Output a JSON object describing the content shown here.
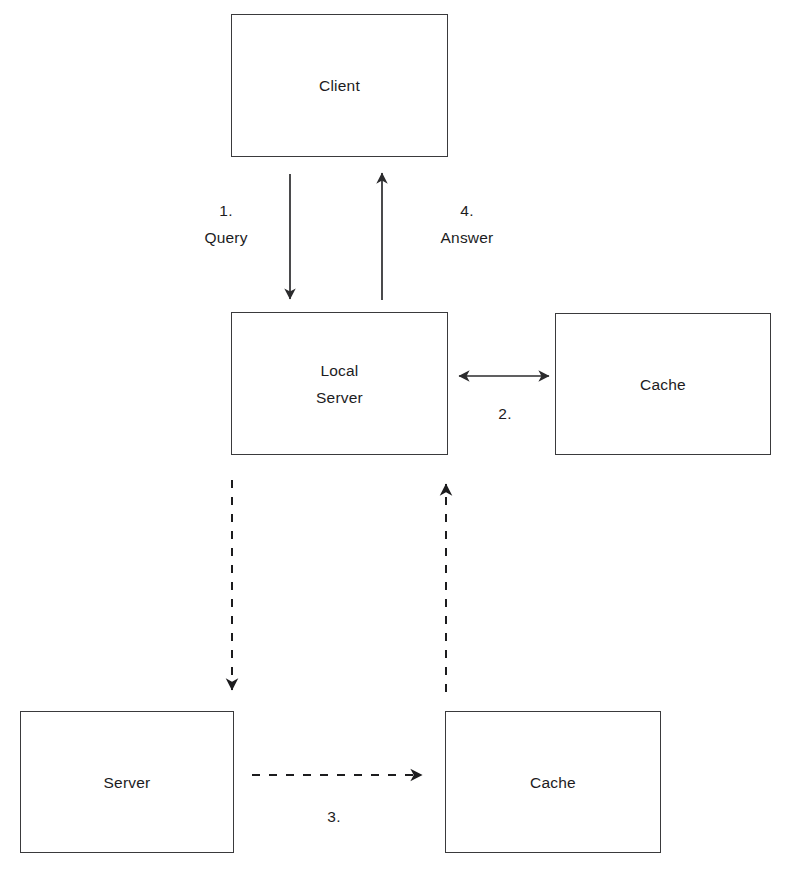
{
  "diagram": {
    "type": "flow-diagram",
    "background_color": "#ffffff",
    "stroke_color": "#3a3a3c",
    "text_color": "#1c1c1e",
    "nodes": [
      {
        "id": "client",
        "label": "Client",
        "x": 231,
        "y": 14,
        "w": 217,
        "h": 143
      },
      {
        "id": "local-server",
        "label": "Local\nServer",
        "x": 231,
        "y": 312,
        "w": 217,
        "h": 143
      },
      {
        "id": "local-cache",
        "label": "Cache",
        "x": 555,
        "y": 313,
        "w": 216,
        "h": 142
      },
      {
        "id": "server",
        "label": "Server",
        "x": 20,
        "y": 711,
        "w": 214,
        "h": 142
      },
      {
        "id": "remote-cache",
        "label": "Cache",
        "x": 445,
        "y": 711,
        "w": 216,
        "h": 142
      }
    ],
    "edges": [
      {
        "id": "client-to-local-server",
        "label": "1.\nQuery",
        "label_x": 226,
        "label_y": 224,
        "style": "solid",
        "direction": "down",
        "from": "client",
        "to": "local-server",
        "x1": 290,
        "y1": 174,
        "x2": 290,
        "y2": 299
      },
      {
        "id": "local-server-to-client",
        "label": "4.\nAnswer",
        "label_x": 467,
        "label_y": 224,
        "style": "solid",
        "direction": "up",
        "from": "local-server",
        "to": "client",
        "x1": 382,
        "y1": 300,
        "x2": 382,
        "y2": 173
      },
      {
        "id": "local-server-to-local-cache",
        "label": "2.",
        "label_x": 505,
        "label_y": 413,
        "style": "solid",
        "direction": "both",
        "from": "local-server",
        "to": "local-cache",
        "x1": 457,
        "y1": 376,
        "x2": 551,
        "y2": 376
      },
      {
        "id": "local-server-to-server",
        "label": "",
        "label_x": 0,
        "label_y": 0,
        "style": "dashed",
        "direction": "down",
        "from": "local-server",
        "to": "server",
        "x1": 232,
        "y1": 480,
        "x2": 232,
        "y2": 692
      },
      {
        "id": "server-to-remote-cache",
        "label": "3.",
        "label_x": 334,
        "label_y": 816,
        "style": "dashed",
        "direction": "right",
        "from": "server",
        "to": "remote-cache",
        "x1": 252,
        "y1": 775,
        "x2": 424,
        "y2": 775
      },
      {
        "id": "remote-cache-to-local-server",
        "label": "",
        "label_x": 0,
        "label_y": 0,
        "style": "dashed",
        "direction": "up",
        "from": "remote-cache",
        "to": "local-server",
        "x1": 446,
        "y1": 692,
        "x2": 446,
        "y2": 481
      }
    ]
  }
}
